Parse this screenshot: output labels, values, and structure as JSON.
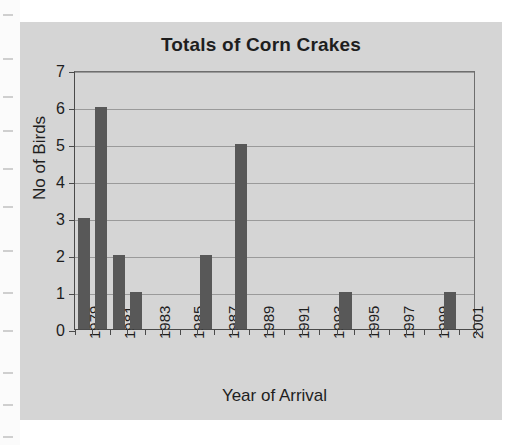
{
  "figure": {
    "title": "Totals of Corn Crakes",
    "xaxis_title": "Year of Arrival",
    "yaxis_title": "No of Birds",
    "background_color": "#d5d5d5",
    "bar_color": "#585858",
    "gridline_color": "#9a9a9a",
    "axis_color": "#4a4a4a"
  },
  "chart_data": {
    "type": "bar",
    "title": "Totals of Corn Crakes",
    "xlabel": "Year of Arrival",
    "ylabel": "No of Birds",
    "ylim": [
      0,
      7
    ],
    "ytick_labels": [
      "0",
      "1",
      "2",
      "3",
      "4",
      "5",
      "6",
      "7"
    ],
    "ytick_values": [
      0,
      1,
      2,
      3,
      4,
      5,
      6,
      7
    ],
    "grid": true,
    "legend": "none",
    "xtick_label_rotation": -90,
    "categories": [
      "1979",
      "1980",
      "1981",
      "1982",
      "1983",
      "1984",
      "1985",
      "1986",
      "1987",
      "1988",
      "1989",
      "1990",
      "1991",
      "1992",
      "1993",
      "1994",
      "1995",
      "1996",
      "1997",
      "1998",
      "1999",
      "2000",
      "2001"
    ],
    "xtick_labels_shown": [
      "1979",
      "",
      "1981",
      "",
      "1983",
      "",
      "1985",
      "",
      "1987",
      "",
      "1989",
      "",
      "1991",
      "",
      "1993",
      "",
      "1995",
      "",
      "1997",
      "",
      "1999",
      "",
      "2001"
    ],
    "values": [
      3,
      6,
      2,
      1,
      0,
      0,
      0,
      2,
      0,
      5,
      0,
      0,
      0,
      0,
      0,
      1,
      0,
      0,
      0,
      0,
      0,
      1,
      0
    ],
    "nonzero_points": [
      {
        "year": "1979",
        "birds": 3
      },
      {
        "year": "1980",
        "birds": 6
      },
      {
        "year": "1981",
        "birds": 2
      },
      {
        "year": "1982",
        "birds": 1
      },
      {
        "year": "1986",
        "birds": 2
      },
      {
        "year": "1988",
        "birds": 5
      },
      {
        "year": "1994",
        "birds": 1
      },
      {
        "year": "2000",
        "birds": 1
      }
    ]
  }
}
